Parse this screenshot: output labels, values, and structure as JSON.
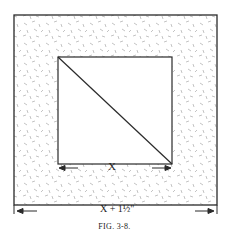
{
  "figure": {
    "caption": "FIG. 3-8.",
    "inner_dimension_label": "X",
    "outer_dimension_label": "X + 1½\"",
    "colors": {
      "line": "#2a2a2a",
      "hatch": "#9a9a9a",
      "background": "#ffffff"
    },
    "outer_square": {
      "x": 14,
      "y": 15,
      "w": 203,
      "h": 190
    },
    "inner_square": {
      "x": 58,
      "y": 57,
      "w": 114,
      "h": 107
    },
    "diagonal": {
      "from": "top-left",
      "to": "bottom-right"
    }
  }
}
